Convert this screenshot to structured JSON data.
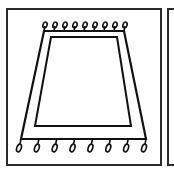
{
  "figure": {
    "colors": {
      "stroke": "#111111",
      "frame": "#2a2a2a",
      "background": "#ffffff"
    },
    "rug": {
      "outer": [
        [
          44,
          31
        ],
        [
          124,
          31
        ],
        [
          146,
          139
        ],
        [
          21,
          139
        ]
      ],
      "inner": [
        [
          51,
          37
        ],
        [
          117,
          37
        ],
        [
          131,
          126
        ],
        [
          35,
          126
        ]
      ],
      "top_tassels": 9,
      "bottom_tassels": 8
    }
  }
}
